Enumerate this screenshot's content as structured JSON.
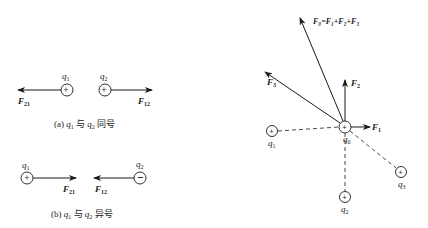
{
  "panel_a": {
    "caption_prefix": "(a)",
    "caption_q1": "q",
    "caption_q1_sub": "1",
    "caption_mid": "与",
    "caption_q2": "q",
    "caption_q2_sub": "2",
    "caption_suffix": "同号",
    "q1_label": "q",
    "q1_sub": "1",
    "q1_sign": "+",
    "q2_label": "q",
    "q2_sub": "2",
    "q2_sign": "+",
    "f21_label": "F",
    "f21_sub": "21",
    "f12_label": "F",
    "f12_sub": "12"
  },
  "panel_b": {
    "caption_prefix": "(b)",
    "caption_q1": "q",
    "caption_q1_sub": "1",
    "caption_mid": "与",
    "caption_q2": "q",
    "caption_q2_sub": "2",
    "caption_suffix": "异号",
    "q1_label": "q",
    "q1_sub": "1",
    "q1_sign": "+",
    "q2_label": "q",
    "q2_sub": "2",
    "q2_sign": "−",
    "f21_label": "F",
    "f21_sub": "21",
    "f12_label": "F",
    "f12_sub": "12"
  },
  "panel_c": {
    "q0_label": "q",
    "q0_sub": "0",
    "q1_label": "q",
    "q1_sub": "1",
    "q2_label": "q",
    "q2_sub": "2",
    "q3_label": "q",
    "q3_sub": "3",
    "f1_label": "F",
    "f1_sub": "1",
    "f2_label": "F",
    "f2_sub": "2",
    "f3_label": "F",
    "f3_sub": "3",
    "f0_equation": "F₀=F₁+F₂+F₃",
    "charge_sign": "+"
  }
}
